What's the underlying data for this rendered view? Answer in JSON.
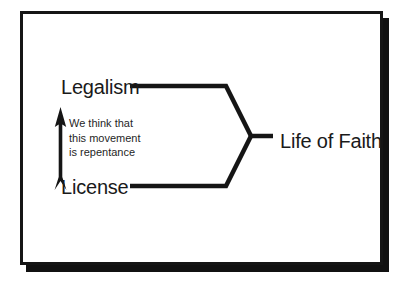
{
  "diagram": {
    "title_present": false,
    "background_color": "#ffffff",
    "frame": {
      "border_color": "#151515",
      "shadow_color": "#111111",
      "fill_color": "#ffffff"
    },
    "line_color": "#151515",
    "nodes": [
      {
        "id": "legalism",
        "label": "Legalism"
      },
      {
        "id": "license",
        "label": "License"
      },
      {
        "id": "life_of_faith",
        "label": "Life of Faith"
      }
    ],
    "annotation": {
      "lines": [
        "We think that",
        "this movement",
        "is repentance"
      ],
      "arrow": {
        "name": "up-arrow",
        "direction": "up",
        "color": "#151515"
      }
    },
    "connectors": [
      {
        "from": "legalism",
        "to": "life_of_faith"
      },
      {
        "from": "license",
        "to": "life_of_faith"
      }
    ]
  }
}
